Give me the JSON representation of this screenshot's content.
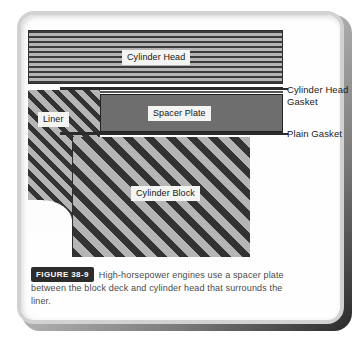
{
  "figure": {
    "badge_label": "FIGURE 38-9",
    "caption": "High-horsepower engines use a spacer plate between the block deck and cylinder head that surrounds the liner."
  },
  "diagram": {
    "parts": [
      {
        "id": "cylinder-head",
        "label": "Cylinder Head",
        "hatch": "horizontal-lines",
        "fill": "#9a9a9a"
      },
      {
        "id": "cylinder-head-gasket",
        "label": "Cylinder Head\nGasket",
        "hatch": "thin-strip",
        "fill": "#2b2b2b"
      },
      {
        "id": "spacer-plate",
        "label": "Spacer Plate",
        "hatch": "solid",
        "fill": "#6e6e6e"
      },
      {
        "id": "plain-gasket",
        "label": "Plain Gasket",
        "hatch": "thin-strip",
        "fill": "#2b2b2b"
      },
      {
        "id": "liner",
        "label": "Liner",
        "hatch": "diagonal-45",
        "fill": "#a0a0a0"
      },
      {
        "id": "cylinder-block",
        "label": "Cylinder Block",
        "hatch": "diagonal-45",
        "fill": "#a0a0a0"
      }
    ],
    "labels": {
      "cylinder_head": "Cylinder Head",
      "spacer_plate": "Spacer Plate",
      "liner": "Liner",
      "cylinder_block": "Cylinder Block",
      "cylinder_head_gasket": "Cylinder Head\nGasket",
      "plain_gasket": "Plain Gasket"
    }
  },
  "colors": {
    "hatch_dark": "#333333",
    "hatch_light": "#b5b5b5",
    "spacer_gray": "#6e6e6e",
    "outline": "#2b2b2b",
    "badge_bg": "#2c2c2c",
    "page_bg": "#fdfdfd"
  }
}
